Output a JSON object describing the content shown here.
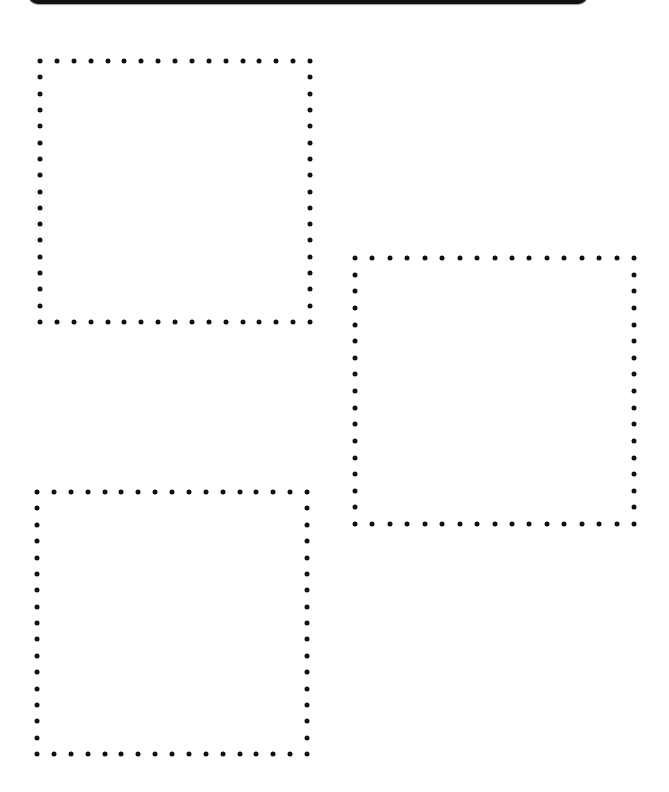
{
  "page": {
    "background": "#ffffff",
    "header_bar": {
      "color": "#111111"
    }
  },
  "boxes": [
    {
      "id": "box-1",
      "x": 40,
      "y": 61,
      "width": 270,
      "height": 261,
      "dots_per_side": 17,
      "content": ""
    },
    {
      "id": "box-2",
      "x": 355,
      "y": 258,
      "width": 279,
      "height": 266,
      "dots_per_side": 17,
      "content": ""
    },
    {
      "id": "box-3",
      "x": 37,
      "y": 492,
      "width": 270,
      "height": 262,
      "dots_per_side": 17,
      "content": ""
    }
  ],
  "dot_color": "#111111"
}
